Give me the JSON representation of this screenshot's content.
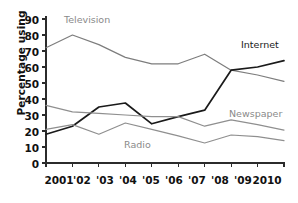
{
  "chart_data": {
    "type": "line",
    "title": "",
    "xlabel": "",
    "ylabel": "Percentage using",
    "x": [
      "2001",
      "'02",
      "'03",
      "'04",
      "'05",
      "'06",
      "'07",
      "'08",
      "'09",
      "2010"
    ],
    "categories": [
      "2001",
      "'02",
      "'03",
      "'04",
      "'05",
      "'06",
      "'07",
      "'08",
      "'09",
      "2010"
    ],
    "ylim": [
      0,
      90
    ],
    "yticks": [
      0,
      10,
      20,
      30,
      40,
      50,
      60,
      70,
      80,
      90
    ],
    "grid": false,
    "legend": "inline-labels",
    "series": [
      {
        "name": "Television",
        "color": "#7d7d7d",
        "values": [
          72,
          80,
          74,
          66,
          62,
          62,
          68,
          58,
          55,
          51
        ]
      },
      {
        "name": "Internet",
        "color": "#1a1a1a",
        "values": [
          18,
          23,
          35,
          37.5,
          24.5,
          29,
          33,
          58,
          60,
          64
        ]
      },
      {
        "name": "Newspaper",
        "color": "#8f8f8f",
        "values": [
          36,
          32,
          31,
          30,
          29,
          29,
          23,
          27,
          24,
          20.5
        ]
      },
      {
        "name": "Radio",
        "color": "#8f8f8f",
        "values": [
          21,
          24,
          18,
          25,
          21,
          17,
          12.5,
          17.5,
          16.5,
          14
        ]
      }
    ],
    "annotations": [
      {
        "text": "Television",
        "series": "Television"
      },
      {
        "text": "Internet",
        "series": "Internet"
      },
      {
        "text": "Newspaper",
        "series": "Newspaper"
      },
      {
        "text": "Radio",
        "series": "Radio"
      }
    ]
  },
  "axis": {
    "y_label": "Percentage using",
    "y_ticks": [
      "90",
      "80",
      "70",
      "60",
      "50",
      "40",
      "30",
      "20",
      "10",
      "0"
    ],
    "x_ticks": [
      "2001",
      "'02",
      "'03",
      "'04",
      "'05",
      "'06",
      "'07",
      "'08",
      "'09",
      "2010"
    ]
  },
  "labels": {
    "television": "Television",
    "internet": "Internet",
    "newspaper": "Newspaper",
    "radio": "Radio"
  },
  "colors": {
    "axis": "#2b2b2b",
    "television": "#7d7d7d",
    "internet": "#1a1a1a",
    "newspaper": "#8f8f8f",
    "radio": "#8f8f8f",
    "text": "#111111",
    "label_gray": "#8a8a8a",
    "background": "#ffffff"
  }
}
